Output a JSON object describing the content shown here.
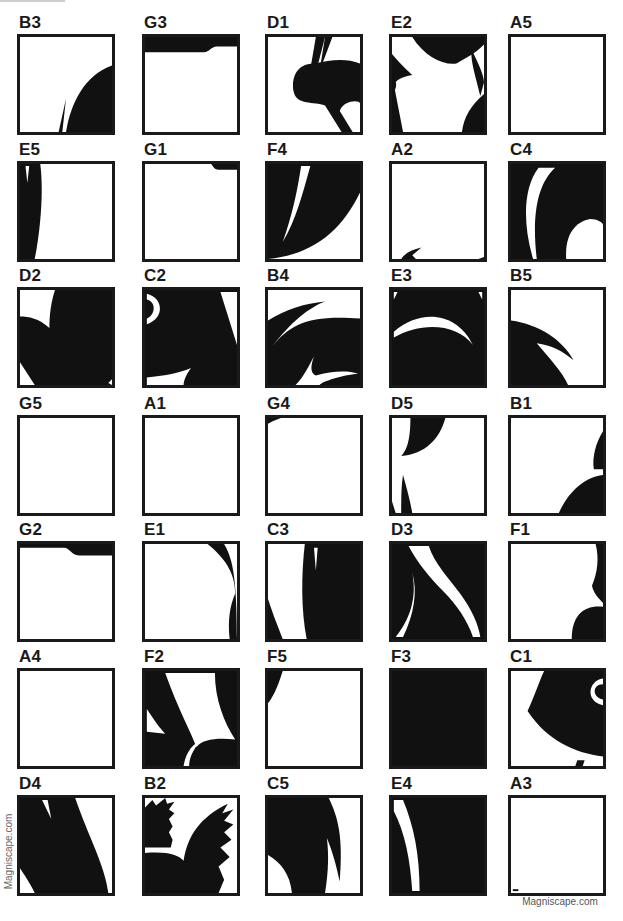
{
  "colors": {
    "ink": "#111111",
    "paper": "#ffffff",
    "border": "#1a1a1a"
  },
  "watermark": {
    "side": "Magniscape.com",
    "bottom": "Magniscape.com"
  },
  "grid": {
    "columns_x": [
      17,
      142,
      265,
      389,
      508
    ],
    "rows_y": [
      14,
      141,
      267,
      395,
      521,
      648,
      775
    ]
  },
  "tiles": [
    {
      "label": "B3",
      "row": 0,
      "col": 0,
      "paths": [
        "M100,30 C70,40 55,70 50,100 L100,100 Z",
        "M42,100 L50,65 L46,100 Z"
      ]
    },
    {
      "label": "G3",
      "row": 0,
      "col": 1,
      "paths": [
        "M0,0 L100,0 L100,10 L78,10 C72,10 70,16 64,16 L0,16 Z"
      ]
    },
    {
      "label": "D1",
      "row": 0,
      "col": 2,
      "paths": [
        "M62,0 L70,0 L56,36 Z",
        "M52,0 L62,0 L54,30 L46,34 Z",
        "M50,28 C30,28 25,45 28,58 C31,72 50,68 62,72 L80,100 L92,100 L78,78 C82,66 100,66 100,70 L100,28 C85,22 68,24 50,28 Z"
      ]
    },
    {
      "label": "E2",
      "row": 0,
      "col": 3,
      "paths": [
        "M22,0 L100,0 L100,8 C90,18 80,22 70,28 C55,30 35,20 22,0 Z",
        "M0,18 C10,30 20,38 22,40 C10,42 4,46 2,50 L12,100 L0,100 Z",
        "M0,42 C6,46 6,54 0,60 Z",
        "M86,12 C94,28 100,40 100,48 L96,62 C90,38 86,28 86,12 Z",
        "M100,60 C86,72 78,84 76,100 L100,100 Z"
      ]
    },
    {
      "label": "A5",
      "row": 0,
      "col": 4,
      "paths": []
    },
    {
      "label": "E5",
      "row": 1,
      "col": 0,
      "paths": [
        "M0,0 L22,0 C26,30 22,70 16,100 L0,100 Z"
      ],
      "holes": [
        "M6,2 L10,2 L8,20 Z"
      ]
    },
    {
      "label": "G1",
      "row": 1,
      "col": 1,
      "paths": [
        "M72,0 L100,0 L100,6 L80,6 C76,6 74,3 72,0 Z"
      ]
    },
    {
      "label": "F4",
      "row": 1,
      "col": 2,
      "paths": [
        "M0,0 L100,0 L100,30 C80,70 50,95 0,100 Z"
      ],
      "holes": [
        "M36,2 L46,2 C38,30 30,60 16,82 C26,55 32,28 36,2 Z"
      ]
    },
    {
      "label": "A2",
      "row": 1,
      "col": 3,
      "paths": [
        "M10,100 C14,94 22,90 32,88 L22,96 L26,100 Z",
        "M94,100 L100,98 L100,100 Z"
      ]
    },
    {
      "label": "C4",
      "row": 1,
      "col": 4,
      "paths": [
        "M0,0 L100,0 L100,100 L0,100 Z"
      ],
      "holes": [
        "M30,4 L48,4 C30,20 22,50 28,100 L24,100 C12,60 14,24 30,4 Z",
        "M60,100 C58,70 74,60 86,58 C94,58 100,62 100,64 L100,100 Z"
      ]
    },
    {
      "label": "D2",
      "row": 2,
      "col": 0,
      "paths": [
        "M0,0 L100,0 L100,100 L0,100 Z"
      ],
      "holes": [
        "M0,0 L38,0 C32,18 32,34 32,40 C20,30 10,28 0,28 Z",
        "M0,76 L16,100 L0,100 Z",
        "M96,98 L100,94 L100,100 Z"
      ]
    },
    {
      "label": "C2",
      "row": 2,
      "col": 1,
      "paths": [
        "M0,0 L100,0 L100,100 L0,100 Z"
      ],
      "holes": [
        "M2,4 C20,8 22,30 2,36 L2,30 C12,26 12,12 2,10 Z",
        "M82,2 L100,2 L100,58 Z",
        "M2,92 C20,90 36,88 50,82 C44,90 42,96 42,100 L2,100 Z"
      ]
    },
    {
      "label": "B4",
      "row": 2,
      "col": 2,
      "paths": [
        "M0,32 C20,20 40,14 62,12 C40,20 20,40 4,60 C24,36 44,26 100,30 L100,100 L0,100 Z"
      ],
      "holes": [
        "M30,100 C40,90 44,80 50,70 C46,80 46,88 52,90 C68,86 84,84 98,88 C80,90 60,96 56,100 Z"
      ]
    },
    {
      "label": "E3",
      "row": 2,
      "col": 3,
      "paths": [
        "M0,0 L100,0 L100,100 L0,100 Z"
      ],
      "holes": [
        "M2,2 L6,2 L2,10 Z",
        "M94,2 L98,2 L98,10 Z",
        "M2,44 C30,20 70,22 88,58 C70,34 30,34 2,50 Z"
      ]
    },
    {
      "label": "B5",
      "row": 2,
      "col": 4,
      "paths": [
        "M0,32 C30,36 56,52 68,74 C56,64 44,58 28,56 C40,70 56,86 62,100 L0,100 Z"
      ]
    },
    {
      "label": "G5",
      "row": 3,
      "col": 0,
      "paths": []
    },
    {
      "label": "A1",
      "row": 3,
      "col": 1,
      "paths": []
    },
    {
      "label": "G4",
      "row": 3,
      "col": 2,
      "paths": [
        "M0,0 L14,0 C8,2 4,4 0,6 Z"
      ]
    },
    {
      "label": "D5",
      "row": 3,
      "col": 3,
      "paths": [
        "M20,0 L58,0 C52,22 36,38 10,40 C16,34 20,24 20,0 Z",
        "M12,60 C16,74 20,88 22,100 L10,100 C10,84 10,72 12,60 Z",
        "M0,88 L4,100 L0,100 Z"
      ]
    },
    {
      "label": "B1",
      "row": 3,
      "col": 4,
      "paths": [
        "M100,14 C92,26 88,42 90,54 L100,54 Z",
        "M100,60 C80,62 62,78 52,100 L100,100 Z"
      ]
    },
    {
      "label": "G2",
      "row": 4,
      "col": 0,
      "paths": [
        "M0,0 L100,0 L100,12 L64,12 C56,12 54,4 48,4 L0,4 Z"
      ]
    },
    {
      "label": "E1",
      "row": 4,
      "col": 1,
      "paths": [
        "M68,0 L86,0 C94,14 100,28 100,100 L92,100 C90,80 92,66 98,52 C98,30 86,14 68,0 Z"
      ]
    },
    {
      "label": "C3",
      "row": 4,
      "col": 2,
      "paths": [
        "M40,0 L100,0 L100,100 L42,100 C36,70 36,34 40,0 Z",
        "M0,58 C6,76 12,90 16,100 L0,100 Z"
      ],
      "holes": [
        "M50,4 L54,4 L52,28 Z"
      ]
    },
    {
      "label": "D3",
      "row": 4,
      "col": 3,
      "paths": [
        "M0,0 L100,0 L100,100 L0,100 Z"
      ],
      "holes": [
        "M18,2 L40,2 C46,20 60,34 74,52 C86,68 94,84 96,98 L88,98 C82,80 70,64 56,50 C40,34 28,20 18,2 Z",
        "M22,30 C26,50 24,74 4,98 L12,98 C24,74 28,50 22,30 Z"
      ]
    },
    {
      "label": "F1",
      "row": 4,
      "col": 4,
      "paths": [
        "M92,0 L100,0 L100,62 C94,56 90,52 88,44 C94,30 96,16 92,0 Z",
        "M100,66 C80,64 66,74 66,100 L100,100 Z"
      ]
    },
    {
      "label": "A4",
      "row": 5,
      "col": 0,
      "paths": []
    },
    {
      "label": "F2",
      "row": 5,
      "col": 1,
      "paths": [
        "M0,0 L100,0 L100,100 L0,100 Z"
      ],
      "holes": [
        "M22,2 L76,2 C76,30 86,54 98,72 C78,70 62,72 56,80 C48,60 36,40 22,2 Z",
        "M2,40 C10,52 16,60 22,66 L2,64 Z",
        "M42,100 C44,86 52,76 62,72 C54,80 48,90 48,100 Z"
      ]
    },
    {
      "label": "F5",
      "row": 5,
      "col": 2,
      "paths": [
        "M0,0 L16,0 C12,12 8,24 0,34 Z"
      ]
    },
    {
      "label": "F3",
      "row": 5,
      "col": 3,
      "paths": [
        "M0,0 L100,0 L100,100 L0,100 Z"
      ]
    },
    {
      "label": "C1",
      "row": 5,
      "col": 4,
      "paths": [
        "M36,0 L100,0 L100,90 C70,86 40,74 18,42 C26,26 30,12 36,0 Z",
        "M72,94 L80,94 L78,100 L70,100 Z"
      ],
      "holes": [
        "M100,8 C84,10 80,32 100,36 L100,30 C88,28 88,14 100,14 Z"
      ]
    },
    {
      "label": "D4",
      "row": 6,
      "col": 0,
      "paths": [
        "M0,0 L60,0 C74,40 92,70 96,100 L16,100 C10,88 4,80 0,74 Z",
        "M0,100 L0,100 Z"
      ],
      "holes": [
        "M24,2 L30,2 L34,22 Z",
        "M0,78 L14,100 L0,100 Z"
      ]
    },
    {
      "label": "B2",
      "row": 6,
      "col": 1,
      "paths": [
        "M0,10 L8,2 L12,8 L22,0 L24,6 L32,4 L26,12 L32,16 L26,22 L30,30 L26,36 L30,44 L28,52 L0,52 Z",
        "M0,58 C24,56 36,60 42,66 C46,40 60,20 90,6 L84,16 L96,12 L86,24 L96,28 L86,36 L94,44 L82,52 L92,62 L80,72 L86,86 L80,100 L0,100 Z"
      ]
    },
    {
      "label": "C5",
      "row": 6,
      "col": 2,
      "paths": [
        "M0,0 L66,0 C76,20 82,40 78,88 C74,70 70,56 64,42 C66,58 66,76 62,100 L26,100 C24,80 14,68 0,60 Z"
      ]
    },
    {
      "label": "E4",
      "row": 6,
      "col": 3,
      "paths": [
        "M0,0 L100,0 L100,100 L0,100 Z"
      ],
      "holes": [
        "M2,2 L12,2 C24,30 30,60 30,98 L22,98 C20,66 14,36 2,14 Z"
      ]
    },
    {
      "label": "A3",
      "row": 6,
      "col": 4,
      "paths": [
        "M2,96 L8,96 L8,98 L2,98 Z"
      ]
    }
  ]
}
